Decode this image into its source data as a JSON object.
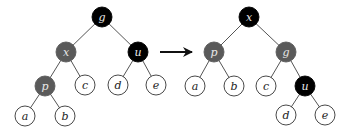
{
  "colors": {
    "black": "#000000",
    "gray": "#5a5a5a",
    "white": "#ffffff",
    "edge": "#555555",
    "stroke": "#333333"
  },
  "radius": 10,
  "trees": [
    {
      "name": "before-rotation",
      "nodes": [
        {
          "id": "g",
          "label": "g",
          "x": 102,
          "y": 17,
          "fill": "black"
        },
        {
          "id": "x",
          "label": "x",
          "x": 66,
          "y": 52,
          "fill": "gray"
        },
        {
          "id": "u",
          "label": "u",
          "x": 138,
          "y": 52,
          "fill": "black"
        },
        {
          "id": "p",
          "label": "p",
          "x": 45,
          "y": 86,
          "fill": "gray"
        },
        {
          "id": "c",
          "label": "c",
          "x": 85,
          "y": 85,
          "fill": "white"
        },
        {
          "id": "d",
          "label": "d",
          "x": 118,
          "y": 85,
          "fill": "white"
        },
        {
          "id": "e",
          "label": "e",
          "x": 156,
          "y": 85,
          "fill": "white"
        },
        {
          "id": "a",
          "label": "a",
          "x": 25,
          "y": 116,
          "fill": "white"
        },
        {
          "id": "b",
          "label": "b",
          "x": 65,
          "y": 116,
          "fill": "white"
        }
      ],
      "edges": [
        [
          "g",
          "x"
        ],
        [
          "g",
          "u"
        ],
        [
          "x",
          "p"
        ],
        [
          "x",
          "c"
        ],
        [
          "u",
          "d"
        ],
        [
          "u",
          "e"
        ],
        [
          "p",
          "a"
        ],
        [
          "p",
          "b"
        ]
      ]
    },
    {
      "name": "after-rotation",
      "nodes": [
        {
          "id": "x",
          "label": "x",
          "x": 249,
          "y": 17,
          "fill": "black"
        },
        {
          "id": "p",
          "label": "p",
          "x": 214,
          "y": 52,
          "fill": "gray"
        },
        {
          "id": "g",
          "label": "g",
          "x": 286,
          "y": 52,
          "fill": "gray"
        },
        {
          "id": "a",
          "label": "a",
          "x": 195,
          "y": 86,
          "fill": "white"
        },
        {
          "id": "b",
          "label": "b",
          "x": 234,
          "y": 86,
          "fill": "white"
        },
        {
          "id": "c",
          "label": "c",
          "x": 266,
          "y": 86,
          "fill": "white"
        },
        {
          "id": "u",
          "label": "u",
          "x": 305,
          "y": 86,
          "fill": "black"
        },
        {
          "id": "d",
          "label": "d",
          "x": 286,
          "y": 115,
          "fill": "white"
        },
        {
          "id": "e",
          "label": "e",
          "x": 325,
          "y": 115,
          "fill": "white"
        }
      ],
      "edges": [
        [
          "x",
          "p"
        ],
        [
          "x",
          "g"
        ],
        [
          "p",
          "a"
        ],
        [
          "p",
          "b"
        ],
        [
          "g",
          "c"
        ],
        [
          "g",
          "u"
        ],
        [
          "u",
          "d"
        ],
        [
          "u",
          "e"
        ]
      ]
    }
  ],
  "arrow": {
    "x1": 160,
    "y1": 52,
    "x2": 192,
    "y2": 52
  }
}
